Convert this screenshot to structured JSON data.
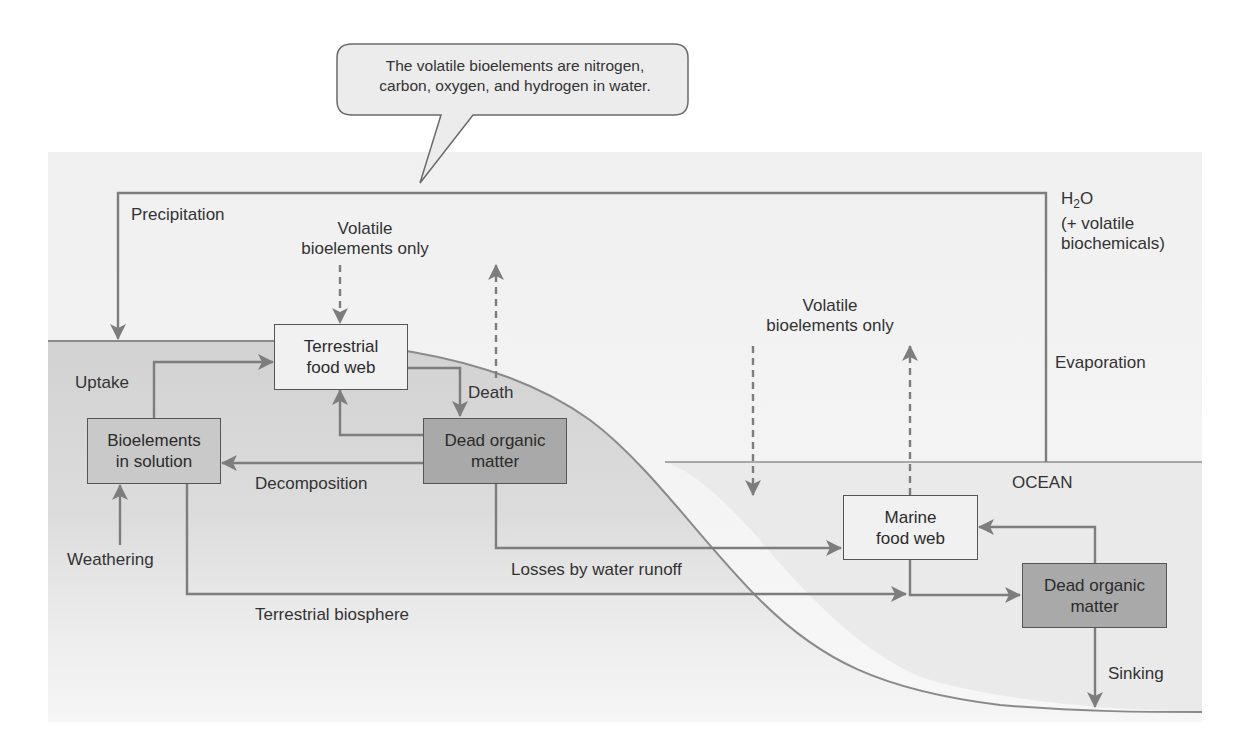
{
  "callout": {
    "line1": "The volatile bioelements are nitrogen,",
    "line2": "carbon, oxygen, and hydrogen in water."
  },
  "labels": {
    "precipitation": "Precipitation",
    "volatile_land_line1": "Volatile",
    "volatile_land_line2": "bioelements only",
    "volatile_ocean_line1": "Volatile",
    "volatile_ocean_line2": "bioelements only",
    "h2o_main": "H",
    "h2o_sub": "2",
    "h2o_end": "O",
    "h2o_line2": "(+ volatile",
    "h2o_line3": "biochemicals)",
    "evaporation": "Evaporation",
    "ocean": "OCEAN",
    "uptake": "Uptake",
    "death": "Death",
    "decomposition": "Decomposition",
    "weathering": "Weathering",
    "losses_runoff": "Losses by water runoff",
    "terrestrial_biosphere": "Terrestrial biosphere",
    "sinking": "Sinking"
  },
  "boxes": {
    "terrestrial_food_web": {
      "line1": "Terrestrial",
      "line2": "food web"
    },
    "bioelements_solution": {
      "line1": "Bioelements",
      "line2": "in solution"
    },
    "dead_organic_land": {
      "line1": "Dead organic",
      "line2": "matter"
    },
    "marine_food_web": {
      "line1": "Marine",
      "line2": "food web"
    },
    "dead_organic_ocean": {
      "line1": "Dead organic",
      "line2": "matter"
    }
  },
  "colors": {
    "panel_bg": "#f3f3f3",
    "land_fill": "#d4d4d4",
    "ocean_fill": "#ececec",
    "line": "#7a7a7a",
    "box_border": "#555555"
  }
}
